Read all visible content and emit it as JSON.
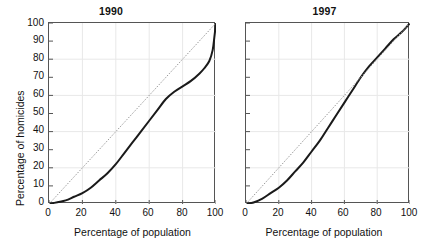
{
  "figure": {
    "width": 427,
    "height": 247,
    "background": "#ffffff",
    "line_color": "#1a1a1a",
    "diagonal_color": "#9a9a9a",
    "grid_color": "#e8e8e8",
    "axis_color": "#555555"
  },
  "axis_titles": {
    "x": "Percentage of population",
    "y": "Percentage of homicides"
  },
  "chart_data": [
    {
      "type": "line",
      "title": "1990",
      "xlabel": "Percentage of population",
      "ylabel": "Percentage of homicides",
      "xlim": [
        0,
        100
      ],
      "ylim": [
        0,
        100
      ],
      "xticks": [
        0,
        20,
        40,
        60,
        80,
        100
      ],
      "yticks": [
        0,
        10,
        20,
        30,
        40,
        50,
        60,
        70,
        80,
        90,
        100
      ],
      "grid": true,
      "grid_x": [
        20,
        40,
        60,
        80
      ],
      "grid_y": [
        20,
        40,
        60,
        80
      ],
      "legend": "none",
      "series": [
        {
          "name": "Lorenz curve 1990",
          "style": "solid",
          "x": [
            0,
            5,
            10,
            15,
            20,
            25,
            30,
            35,
            40,
            45,
            50,
            55,
            60,
            65,
            70,
            75,
            80,
            85,
            90,
            93,
            96,
            98,
            99,
            100
          ],
          "values": [
            0,
            1,
            2,
            4,
            6,
            9,
            13,
            17,
            22,
            28,
            34,
            40,
            46,
            52,
            58,
            62,
            65,
            68,
            72,
            75,
            79,
            85,
            92,
            100
          ]
        },
        {
          "name": "Line of equality",
          "style": "dotted",
          "x": [
            0,
            100
          ],
          "values": [
            0,
            100
          ]
        }
      ]
    },
    {
      "type": "line",
      "title": "1997",
      "xlabel": "Percentage of population",
      "ylabel": "Percentage of homicides",
      "xlim": [
        0,
        100
      ],
      "ylim": [
        0,
        100
      ],
      "xticks": [
        0,
        20,
        40,
        60,
        80,
        100
      ],
      "yticks": [
        0,
        10,
        20,
        30,
        40,
        50,
        60,
        70,
        80,
        90,
        100
      ],
      "grid": true,
      "grid_x": [
        20,
        40,
        60,
        80
      ],
      "grid_y": [
        20,
        40,
        60,
        80
      ],
      "legend": "none",
      "series": [
        {
          "name": "Lorenz curve 1997",
          "style": "solid",
          "x": [
            0,
            5,
            10,
            15,
            20,
            25,
            30,
            35,
            40,
            45,
            50,
            55,
            60,
            65,
            70,
            75,
            80,
            85,
            90,
            95,
            100
          ],
          "values": [
            0,
            1,
            3,
            6,
            9,
            13,
            18,
            23,
            29,
            35,
            42,
            49,
            56,
            63,
            70,
            76,
            81,
            86,
            91,
            95,
            100
          ]
        },
        {
          "name": "Line of equality",
          "style": "dotted",
          "x": [
            0,
            100
          ],
          "values": [
            0,
            100
          ]
        }
      ]
    }
  ],
  "panels": [
    {
      "title": "1990",
      "show_ytick_labels": true,
      "ytick_labels": [
        "100",
        "90",
        "80",
        "70",
        "60",
        "50",
        "40",
        "30",
        "20",
        "10",
        "0"
      ],
      "xtick_labels": [
        "0",
        "20",
        "40",
        "60",
        "80",
        "100"
      ]
    },
    {
      "title": "1997",
      "show_ytick_labels": false,
      "ytick_labels": [],
      "xtick_labels": [
        "0",
        "20",
        "40",
        "60",
        "80",
        "100"
      ]
    }
  ]
}
